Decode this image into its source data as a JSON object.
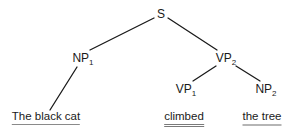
{
  "diagram": {
    "type": "syntax-tree",
    "nodes": {
      "S": {
        "label": "S",
        "subscript": ""
      },
      "NP1": {
        "label": "NP",
        "subscript": "1"
      },
      "VP2": {
        "label": "VP",
        "subscript": "2"
      },
      "VP1": {
        "label": "VP",
        "subscript": "1"
      },
      "NP2": {
        "label": "NP",
        "subscript": "2"
      }
    },
    "leaves": {
      "subject": {
        "text": "The black cat",
        "underline": "single"
      },
      "verb": {
        "text": "climbed",
        "underline": "double"
      },
      "object": {
        "text": "the tree",
        "underline": "thick-grey"
      }
    },
    "edges": [
      {
        "from": "S",
        "to": "NP1"
      },
      {
        "from": "S",
        "to": "VP2"
      },
      {
        "from": "NP1",
        "to": "subject"
      },
      {
        "from": "VP2",
        "to": "VP1"
      },
      {
        "from": "VP2",
        "to": "NP2"
      }
    ]
  }
}
